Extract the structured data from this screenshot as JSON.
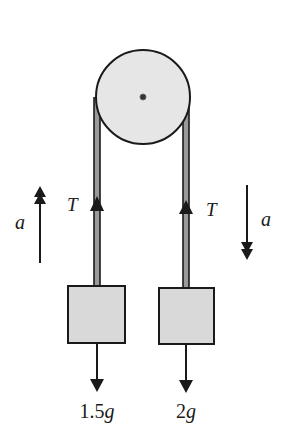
{
  "diagram": {
    "type": "atwood-machine",
    "colors": {
      "stroke": "#1a1a1a",
      "pulley_fill": "#e6e6e6",
      "block_fill": "#d9d9d9",
      "rope_fill": "#9a9a9a",
      "background": "#ffffff"
    },
    "pulley": {
      "cx": 143,
      "cy": 97,
      "r": 47
    },
    "left_side": {
      "rope_x": 97,
      "tension_label": "T",
      "acceleration_label": "a",
      "acceleration_direction": "up",
      "weight_label_number": "1.5",
      "weight_label_symbol": "g",
      "block": {
        "x": 68,
        "y": 286,
        "w": 57,
        "h": 57
      }
    },
    "right_side": {
      "rope_x": 186,
      "tension_label": "T",
      "acceleration_label": "a",
      "acceleration_direction": "down",
      "weight_label_number": "2",
      "weight_label_symbol": "g",
      "block": {
        "x": 159,
        "y": 288,
        "w": 55,
        "h": 56
      }
    }
  }
}
